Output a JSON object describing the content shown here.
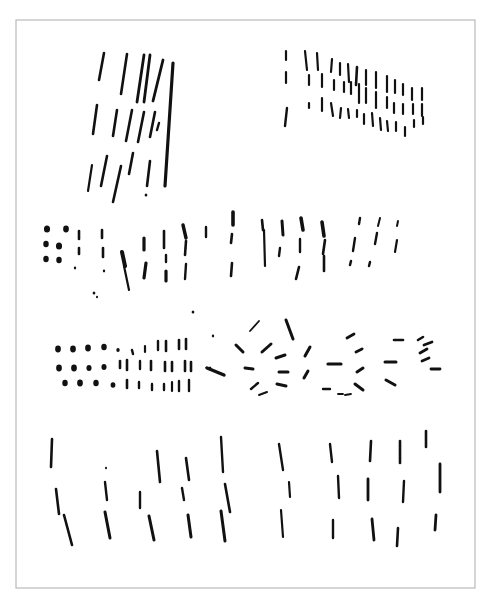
{
  "page": {
    "width": 490,
    "height": 605,
    "background": "#ffffff",
    "ink_color": "#111111",
    "frame": {
      "x": 16,
      "y": 20,
      "w": 459,
      "h": 568,
      "stroke": "#b9b9b9"
    }
  },
  "groups": [
    {
      "name": "tall-slanted-strokes-top-left",
      "strokes": [
        [
          104,
          53,
          99,
          80,
          2.6
        ],
        [
          127,
          54,
          121,
          94,
          2.6
        ],
        [
          144,
          55,
          137,
          102,
          2.8
        ],
        [
          150,
          55,
          144,
          102,
          2.8
        ],
        [
          163,
          60,
          153,
          101,
          2.8
        ],
        [
          173,
          63,
          165,
          186,
          3.2
        ],
        [
          97,
          105,
          93,
          134,
          2.6
        ],
        [
          117,
          110,
          113,
          136,
          2.6
        ],
        [
          132,
          110,
          126,
          141,
          2.6
        ],
        [
          144,
          112,
          138,
          142,
          2.6
        ],
        [
          155,
          112,
          150,
          137,
          2.6
        ],
        [
          159,
          123,
          157,
          130,
          2.4
        ],
        [
          92,
          165,
          88,
          191,
          2.2
        ],
        [
          107,
          156,
          101,
          186,
          2.6
        ],
        [
          121,
          166,
          113,
          202,
          2.6
        ],
        [
          133,
          153,
          129,
          174,
          2.6
        ],
        [
          150,
          161,
          147,
          186,
          2.6
        ]
      ],
      "dots": [
        [
          146,
          195,
          1.6
        ]
      ]
    },
    {
      "name": "vertical-dash-grid-top-right",
      "strokes": [
        [
          286,
          51,
          286,
          60,
          2.2
        ],
        [
          305,
          51,
          307,
          70,
          2.2
        ],
        [
          317,
          53,
          318,
          70,
          2.2
        ],
        [
          332,
          59,
          331,
          72,
          2.2
        ],
        [
          340,
          63,
          340,
          75,
          2.2
        ],
        [
          348,
          64,
          349,
          82,
          2.2
        ],
        [
          357,
          67,
          356,
          85,
          2.6
        ],
        [
          366,
          70,
          366,
          85,
          2.2
        ],
        [
          376,
          72,
          376,
          88,
          2.2
        ],
        [
          387,
          76,
          387,
          92,
          2.2
        ],
        [
          395,
          80,
          395,
          93,
          2.2
        ],
        [
          403,
          84,
          403,
          95,
          2.2
        ],
        [
          412,
          88,
          412,
          100,
          2.2
        ],
        [
          422,
          88,
          422,
          100,
          2.2
        ],
        [
          286,
          72,
          286,
          83,
          2.2
        ],
        [
          309,
          75,
          309,
          85,
          2.2
        ],
        [
          322,
          74,
          322,
          87,
          2.2
        ],
        [
          334,
          80,
          334,
          90,
          2.2
        ],
        [
          344,
          82,
          344,
          92,
          2.2
        ],
        [
          351,
          82,
          351,
          94,
          2.2
        ],
        [
          359,
          84,
          359,
          103,
          2.2
        ],
        [
          366,
          88,
          366,
          103,
          2.2
        ],
        [
          376,
          92,
          376,
          108,
          2.2
        ],
        [
          387,
          97,
          387,
          108,
          2.2
        ],
        [
          394,
          103,
          394,
          113,
          2.2
        ],
        [
          403,
          104,
          403,
          114,
          2.2
        ],
        [
          413,
          104,
          413,
          114,
          2.2
        ],
        [
          422,
          104,
          422,
          116,
          2.2
        ],
        [
          287,
          108,
          285,
          126,
          2.4
        ],
        [
          309,
          103,
          309,
          108,
          2.2
        ],
        [
          322,
          98,
          322,
          111,
          2.2
        ],
        [
          331,
          103,
          333,
          116,
          2.2
        ],
        [
          341,
          108,
          340,
          118,
          2.2
        ],
        [
          348,
          109,
          349,
          118,
          2.2
        ],
        [
          357,
          110,
          357,
          117,
          2.2
        ],
        [
          364,
          114,
          364,
          124,
          2.2
        ],
        [
          372,
          113,
          373,
          126,
          2.2
        ],
        [
          380,
          118,
          381,
          130,
          2.2
        ],
        [
          387,
          121,
          388,
          131,
          2.2
        ],
        [
          396,
          122,
          396,
          131,
          2.2
        ],
        [
          405,
          127,
          405,
          136,
          2.2
        ],
        [
          414,
          120,
          414,
          127,
          2.2
        ],
        [
          423,
          117,
          423,
          124,
          2.2
        ]
      ],
      "dots": []
    },
    {
      "name": "dot-and-dash-band-middle",
      "strokes": [
        [
          79,
          231,
          79,
          239,
          2.6
        ],
        [
          79,
          248,
          79,
          254,
          2.6
        ],
        [
          102,
          230,
          102,
          238,
          2.6
        ],
        [
          103,
          248,
          103,
          257,
          2.6
        ],
        [
          122,
          252,
          125,
          266,
          4.0
        ],
        [
          124,
          266,
          129,
          290,
          2.2
        ],
        [
          144,
          238,
          144,
          250,
          3.2
        ],
        [
          146,
          263,
          144,
          278,
          3.2
        ],
        [
          164,
          231,
          164,
          248,
          2.6
        ],
        [
          166,
          255,
          166,
          262,
          2.4
        ],
        [
          166,
          271,
          166,
          281,
          3.2
        ],
        [
          183,
          225,
          186,
          238,
          3.4
        ],
        [
          186,
          241,
          185,
          255,
          2.6
        ],
        [
          186,
          264,
          185,
          279,
          2.4
        ],
        [
          206,
          227,
          206,
          237,
          2.4
        ],
        [
          233,
          212,
          233,
          225,
          3.6
        ],
        [
          232,
          234,
          231,
          243,
          2.6
        ],
        [
          232,
          263,
          231,
          276,
          2.6
        ],
        [
          262,
          220,
          263,
          230,
          2.6
        ],
        [
          264,
          230,
          265,
          266,
          2.2
        ],
        [
          282,
          221,
          283,
          235,
          3.0
        ],
        [
          280,
          248,
          279,
          256,
          2.4
        ],
        [
          301,
          218,
          303,
          230,
          3.6
        ],
        [
          300,
          239,
          300,
          252,
          2.4
        ],
        [
          299,
          267,
          296,
          279,
          2.6
        ],
        [
          322,
          222,
          324,
          236,
          3.6
        ],
        [
          325,
          240,
          323,
          254,
          2.6
        ],
        [
          324,
          256,
          324,
          271,
          2.6
        ],
        [
          360,
          218,
          359,
          224,
          2.4
        ],
        [
          355,
          238,
          353,
          251,
          2.4
        ],
        [
          351,
          261,
          350,
          265,
          2.4
        ],
        [
          380,
          218,
          378,
          226,
          2.0
        ],
        [
          377,
          233,
          375,
          244,
          2.4
        ],
        [
          370,
          262,
          369,
          266,
          2.4
        ],
        [
          398,
          221,
          397,
          226,
          2.0
        ],
        [
          397,
          240,
          395,
          252,
          2.2
        ]
      ],
      "dots": [
        [
          47,
          229,
          3.6
        ],
        [
          66,
          229,
          3.4
        ],
        [
          46,
          244,
          3.2
        ],
        [
          59,
          246,
          3.6
        ],
        [
          46,
          259,
          3.2
        ],
        [
          59,
          260,
          3.2
        ],
        [
          75,
          268,
          1.4
        ],
        [
          104,
          271,
          1.4
        ],
        [
          94,
          293,
          1.6
        ],
        [
          97,
          297,
          1.2
        ],
        [
          193,
          312,
          1.6
        ]
      ]
    },
    {
      "name": "dot-grid-lower-left",
      "strokes": [
        [
          132,
          350,
          133,
          354,
          2.4
        ],
        [
          145,
          346,
          145,
          352,
          2.2
        ],
        [
          158,
          341,
          158,
          350,
          2.4
        ],
        [
          166,
          341,
          166,
          351,
          2.6
        ],
        [
          179,
          340,
          179,
          349,
          2.6
        ],
        [
          186,
          339,
          186,
          349,
          2.6
        ],
        [
          120,
          361,
          120,
          368,
          2.6
        ],
        [
          127,
          360,
          127,
          370,
          2.6
        ],
        [
          140,
          361,
          140,
          369,
          2.4
        ],
        [
          151,
          361,
          151,
          370,
          2.6
        ],
        [
          165,
          362,
          165,
          371,
          2.6
        ],
        [
          172,
          362,
          172,
          371,
          2.6
        ],
        [
          185,
          361,
          185,
          371,
          2.6
        ],
        [
          191,
          362,
          191,
          371,
          2.6
        ],
        [
          127,
          380,
          127,
          388,
          2.6
        ],
        [
          139,
          382,
          139,
          388,
          2.4
        ],
        [
          152,
          384,
          152,
          390,
          2.4
        ],
        [
          164,
          384,
          164,
          390,
          2.4
        ],
        [
          172,
          382,
          172,
          391,
          2.2
        ],
        [
          179,
          381,
          179,
          391,
          2.4
        ],
        [
          189,
          380,
          189,
          391,
          2.4
        ]
      ],
      "dots": [
        [
          58,
          349,
          3.4
        ],
        [
          73,
          349,
          3.4
        ],
        [
          88,
          348,
          3.4
        ],
        [
          104,
          347,
          3.2
        ],
        [
          118,
          350,
          2.0
        ],
        [
          59,
          368,
          3.4
        ],
        [
          74,
          368,
          3.4
        ],
        [
          89,
          368,
          3.0
        ],
        [
          104,
          367,
          3.0
        ],
        [
          65,
          383,
          3.2
        ],
        [
          80,
          383,
          3.4
        ],
        [
          96,
          383,
          3.2
        ],
        [
          113,
          385,
          2.8
        ],
        [
          213,
          336,
          1.4
        ],
        [
          210,
          368,
          1.6
        ]
      ]
    },
    {
      "name": "scattered-dashes-lower-right",
      "strokes": [
        [
          250,
          331,
          259,
          321,
          1.8
        ],
        [
          286,
          320,
          293,
          339,
          3.0
        ],
        [
          236,
          345,
          243,
          352,
          3.0
        ],
        [
          262,
          352,
          271,
          344,
          3.0
        ],
        [
          276,
          358,
          285,
          355,
          3.0
        ],
        [
          207,
          368,
          224,
          375,
          3.4
        ],
        [
          245,
          368,
          253,
          369,
          3.0
        ],
        [
          279,
          372,
          288,
          372,
          3.0
        ],
        [
          305,
          356,
          310,
          347,
          3.0
        ],
        [
          251,
          389,
          258,
          383,
          2.4
        ],
        [
          277,
          384,
          286,
          386,
          3.0
        ],
        [
          259,
          395,
          267,
          392,
          2.0
        ],
        [
          304,
          378,
          308,
          371,
          3.0
        ],
        [
          323,
          389,
          330,
          389,
          2.4
        ],
        [
          338,
          394,
          343,
          394,
          1.8
        ],
        [
          347,
          338,
          354,
          334,
          2.8
        ],
        [
          356,
          352,
          362,
          349,
          2.8
        ],
        [
          328,
          364,
          341,
          364,
          3.2
        ],
        [
          357,
          372,
          363,
          368,
          3.0
        ],
        [
          355,
          384,
          363,
          390,
          3.0
        ],
        [
          394,
          340,
          403,
          340,
          2.6
        ],
        [
          418,
          340,
          423,
          337,
          2.6
        ],
        [
          424,
          345,
          432,
          342,
          2.8
        ],
        [
          385,
          362,
          396,
          362,
          3.0
        ],
        [
          420,
          353,
          427,
          349,
          2.8
        ],
        [
          422,
          361,
          429,
          358,
          2.8
        ],
        [
          431,
          369,
          440,
          369,
          2.8
        ],
        [
          386,
          380,
          395,
          385,
          3.0
        ],
        [
          345,
          395,
          351,
          394,
          1.8
        ]
      ],
      "dots": []
    },
    {
      "name": "vertical-dashes-bottom-left",
      "strokes": [
        [
          52,
          439,
          51,
          467,
          2.6
        ],
        [
          56,
          489,
          59,
          514,
          2.6
        ],
        [
          64,
          515,
          72,
          545,
          2.6
        ],
        [
          157,
          451,
          160,
          482,
          2.6
        ],
        [
          186,
          458,
          189,
          480,
          2.6
        ],
        [
          221,
          437,
          223,
          472,
          2.4
        ],
        [
          105,
          482,
          107,
          500,
          2.4
        ],
        [
          140,
          492,
          140,
          508,
          2.4
        ],
        [
          182,
          488,
          184,
          500,
          2.4
        ],
        [
          225,
          484,
          230,
          512,
          2.6
        ],
        [
          105,
          512,
          110,
          538,
          3.0
        ],
        [
          149,
          516,
          154,
          540,
          3.0
        ],
        [
          188,
          515,
          191,
          537,
          3.0
        ],
        [
          221,
          511,
          225,
          541,
          3.0
        ]
      ],
      "dots": [
        [
          106,
          468,
          1.2
        ]
      ]
    },
    {
      "name": "vertical-dashes-bottom-right",
      "strokes": [
        [
          279,
          444,
          283,
          470,
          2.4
        ],
        [
          330,
          444,
          332,
          462,
          2.4
        ],
        [
          371,
          441,
          370,
          461,
          2.6
        ],
        [
          400,
          441,
          400,
          463,
          2.6
        ],
        [
          426,
          431,
          426,
          447,
          2.6
        ],
        [
          289,
          482,
          290,
          497,
          2.2
        ],
        [
          338,
          476,
          339,
          498,
          2.4
        ],
        [
          368,
          479,
          368,
          500,
          2.8
        ],
        [
          404,
          481,
          403,
          502,
          2.4
        ],
        [
          440,
          464,
          440,
          492,
          2.8
        ],
        [
          281,
          510,
          283,
          537,
          2.2
        ],
        [
          333,
          520,
          333,
          538,
          2.4
        ],
        [
          372,
          519,
          374,
          540,
          2.8
        ],
        [
          398,
          528,
          397,
          546,
          2.6
        ],
        [
          436,
          515,
          435,
          530,
          2.8
        ]
      ],
      "dots": []
    }
  ]
}
